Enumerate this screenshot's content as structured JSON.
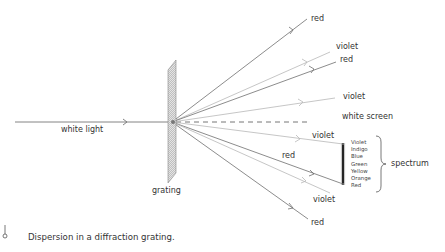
{
  "diagram": {
    "title": "Dispersion in a diffraction grating",
    "labels": {
      "incident": "white light",
      "grating": "grating",
      "screen": "white screen",
      "spectrum": "spectrum",
      "ray_top_red": "red",
      "ray_upper_violet": "violet",
      "ray_upper_red": "red",
      "ray_mid_violet": "violet",
      "ray_lower_violet": "violet",
      "ray_lower_red": "red",
      "ray_bottom_violet": "violet",
      "ray_bottom_red": "red"
    },
    "spectrum_colors": [
      "Violet",
      "Indigo",
      "Blue",
      "Green",
      "Yellow",
      "Orange",
      "Red"
    ],
    "caption": "Dispersion in a diffraction grating.",
    "colors": {
      "red_ray": "#6e6e6e",
      "violet_ray": "#b8b8b8",
      "text": "#333333",
      "grating_fill": "#d0d0d0"
    }
  }
}
